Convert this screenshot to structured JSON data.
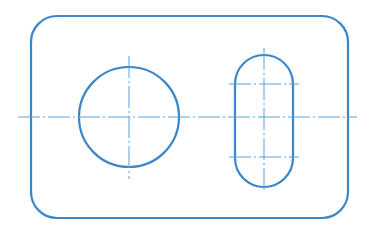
{
  "diagram": {
    "type": "technical-drawing",
    "canvas": {
      "width": 379,
      "height": 229
    },
    "colors": {
      "background": "#ffffff",
      "outline": "#3a86c8",
      "centerline": "#5aa0d8"
    },
    "stroke": {
      "outline_width": 2.2,
      "centerline_width": 1,
      "centerline_dash": "22 3 2 3"
    },
    "plate": {
      "x": 31,
      "y": 16,
      "width": 317,
      "height": 202,
      "corner_radius": 26
    },
    "hole": {
      "cx": 129,
      "cy": 117,
      "r": 50
    },
    "slot": {
      "x": 235,
      "y": 55,
      "width": 58,
      "height": 132,
      "corner_radius": 29,
      "arc_centers_y": [
        84,
        157
      ],
      "cx": 264
    },
    "centerlines": {
      "main_horizontal": {
        "x1": 18,
        "y1": 117,
        "x2": 357,
        "y2": 117
      },
      "hole_vertical": {
        "x1": 129,
        "y1": 56,
        "x2": 129,
        "y2": 179
      },
      "slot_vertical": {
        "x1": 264,
        "y1": 48,
        "x2": 264,
        "y2": 193
      },
      "slot_upper_horizontal": {
        "x1": 229,
        "y1": 84,
        "x2": 299,
        "y2": 84
      },
      "slot_lower_horizontal": {
        "x1": 229,
        "y1": 157,
        "x2": 299,
        "y2": 157
      }
    }
  }
}
